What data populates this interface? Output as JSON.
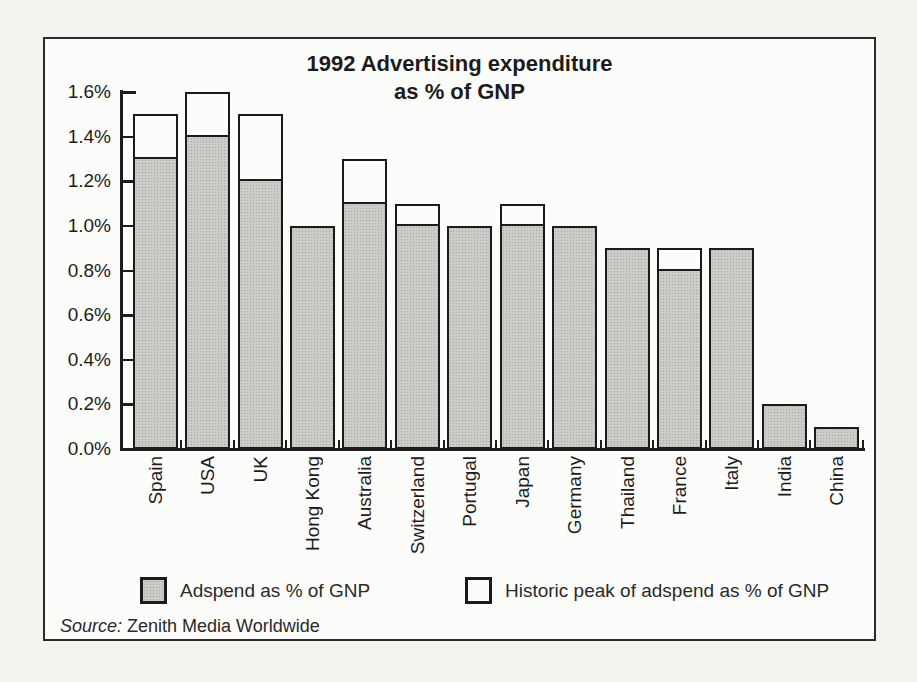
{
  "chart_data": {
    "type": "bar",
    "title": "1992 Advertising expenditure as % of GNP",
    "title_lines": [
      "1992 Advertising expenditure",
      "as % of GNP"
    ],
    "categories": [
      "Spain",
      "USA",
      "UK",
      "Hong Kong",
      "Australia",
      "Switzerland",
      "Portugal",
      "Japan",
      "Germany",
      "Thailand",
      "France",
      "Italy",
      "India",
      "China"
    ],
    "series": [
      {
        "name": "Adspend as % of GNP",
        "values": [
          1.3,
          1.4,
          1.2,
          1.0,
          1.1,
          1.0,
          1.0,
          1.0,
          1.0,
          0.9,
          0.8,
          0.9,
          0.2,
          0.1
        ]
      },
      {
        "name": "Historic peak of adspend as % of GNP",
        "values": [
          1.5,
          1.6,
          1.5,
          1.0,
          1.3,
          1.1,
          1.0,
          1.1,
          1.0,
          0.9,
          0.9,
          0.9,
          0.2,
          0.1
        ]
      }
    ],
    "xlabel": "",
    "ylabel": "",
    "ylim": [
      0,
      1.6
    ],
    "yticks": [
      "0.0%",
      "0.2%",
      "0.4%",
      "0.6%",
      "0.8%",
      "1.0%",
      "1.2%",
      "1.4%",
      "1.6%"
    ],
    "grid": false,
    "legend_position": "bottom",
    "colors": {
      "adspend_fill": "#cbcbc7",
      "peak_fill": "#fcfcfa",
      "line": "#1b1b1b"
    }
  },
  "source": {
    "prefix": "Source:",
    "text": "Zenith Media Worldwide"
  }
}
